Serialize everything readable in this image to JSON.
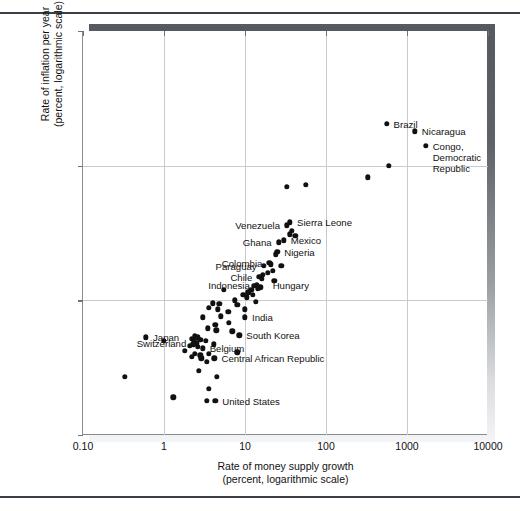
{
  "figure": {
    "background_color": "#ffffff",
    "point_color": "#111111",
    "grid_color": "#c8cbce",
    "shadow_color": "#5d6268",
    "rules": [
      "top-rule",
      "bottom-rule"
    ]
  },
  "chart_data": {
    "type": "scatter",
    "title": "",
    "xlabel_lines": [
      "Rate of money supply growth",
      "(percent, logarithmic scale)"
    ],
    "ylabel_lines": [
      "Rate of inflation per year",
      "(percent, logarithmic scale)"
    ],
    "xscale": "log",
    "yscale": "log",
    "xlim": [
      0.1,
      10000
    ],
    "ylim": [
      1,
      1000
    ],
    "xticks": [
      0.1,
      1,
      10,
      100,
      1000,
      10000
    ],
    "xticklabels": [
      "0.10",
      "1",
      "10",
      "100",
      "1000",
      "10000"
    ],
    "yticks": [
      1,
      10,
      100,
      1000
    ],
    "yticklabels": [
      "1",
      "10",
      "100",
      "1000"
    ],
    "grid": true,
    "legend": "none",
    "labeled_points": [
      {
        "label": "Brazil",
        "x": 560,
        "y": 205,
        "side": "right"
      },
      {
        "label": "Nicaragua",
        "x": 1250,
        "y": 180,
        "side": "right"
      },
      {
        "label": "Congo,\nDemocratic\nRepublic",
        "x": 1700,
        "y": 140,
        "side": "right"
      },
      {
        "label": "Sierra Leone",
        "x": 36,
        "y": 38,
        "side": "right"
      },
      {
        "label": "Venezuela",
        "x": 33,
        "y": 36,
        "side": "left"
      },
      {
        "label": "Mexico",
        "x": 30,
        "y": 28,
        "side": "right"
      },
      {
        "label": "Ghana",
        "x": 26,
        "y": 27,
        "side": "left"
      },
      {
        "label": "Nigeria",
        "x": 25,
        "y": 23,
        "side": "right"
      },
      {
        "label": "Colombia",
        "x": 20,
        "y": 19,
        "side": "left"
      },
      {
        "label": "Paraguay",
        "x": 17,
        "y": 18,
        "side": "left"
      },
      {
        "label": "Chile",
        "x": 15,
        "y": 15,
        "side": "left"
      },
      {
        "label": "Indonesia",
        "x": 14,
        "y": 13,
        "side": "left"
      },
      {
        "label": "Hungary",
        "x": 18,
        "y": 13,
        "side": "right"
      },
      {
        "label": "India",
        "x": 10,
        "y": 7.5,
        "side": "right"
      },
      {
        "label": "Japan",
        "x": 0.6,
        "y": 5.3,
        "side": "right"
      },
      {
        "label": "South Korea",
        "x": 8.5,
        "y": 5.5,
        "side": "right"
      },
      {
        "label": "Switzerland",
        "x": 2.3,
        "y": 4.8,
        "side": "left"
      },
      {
        "label": "Belgium",
        "x": 3.0,
        "y": 4.4,
        "side": "right"
      },
      {
        "label": "Central African Republic",
        "x": 4.2,
        "y": 3.7,
        "side": "right"
      },
      {
        "label": "United States",
        "x": 4.3,
        "y": 1.8,
        "side": "right"
      }
    ],
    "points": [
      {
        "x": 1700,
        "y": 140
      },
      {
        "x": 1250,
        "y": 180
      },
      {
        "x": 560,
        "y": 205
      },
      {
        "x": 600,
        "y": 100
      },
      {
        "x": 330,
        "y": 82
      },
      {
        "x": 56,
        "y": 72
      },
      {
        "x": 33,
        "y": 70
      },
      {
        "x": 36,
        "y": 38
      },
      {
        "x": 38,
        "y": 33
      },
      {
        "x": 36,
        "y": 31
      },
      {
        "x": 42,
        "y": 30
      },
      {
        "x": 33,
        "y": 36
      },
      {
        "x": 30,
        "y": 28
      },
      {
        "x": 26,
        "y": 27
      },
      {
        "x": 25,
        "y": 23
      },
      {
        "x": 24,
        "y": 22
      },
      {
        "x": 20,
        "y": 19
      },
      {
        "x": 21,
        "y": 18.5
      },
      {
        "x": 17,
        "y": 18
      },
      {
        "x": 28,
        "y": 18
      },
      {
        "x": 22,
        "y": 16.5
      },
      {
        "x": 19,
        "y": 16
      },
      {
        "x": 15,
        "y": 15
      },
      {
        "x": 16,
        "y": 14.5
      },
      {
        "x": 16.5,
        "y": 15.5
      },
      {
        "x": 23,
        "y": 14
      },
      {
        "x": 14,
        "y": 13
      },
      {
        "x": 13,
        "y": 12.8
      },
      {
        "x": 15.5,
        "y": 12.5
      },
      {
        "x": 14.5,
        "y": 12.2
      },
      {
        "x": 12,
        "y": 12
      },
      {
        "x": 5.5,
        "y": 12
      },
      {
        "x": 11,
        "y": 11.5
      },
      {
        "x": 12.5,
        "y": 11
      },
      {
        "x": 9.5,
        "y": 11
      },
      {
        "x": 10.5,
        "y": 10.5
      },
      {
        "x": 13.5,
        "y": 9.8
      },
      {
        "x": 7.5,
        "y": 10
      },
      {
        "x": 8,
        "y": 9.3
      },
      {
        "x": 4,
        "y": 9.5
      },
      {
        "x": 4.8,
        "y": 9.4
      },
      {
        "x": 3.6,
        "y": 8.8
      },
      {
        "x": 4.6,
        "y": 8.6
      },
      {
        "x": 10,
        "y": 8.6
      },
      {
        "x": 6.2,
        "y": 8.2
      },
      {
        "x": 3.0,
        "y": 7.5
      },
      {
        "x": 5.0,
        "y": 7.6
      },
      {
        "x": 10,
        "y": 7.5
      },
      {
        "x": 6.3,
        "y": 6.8
      },
      {
        "x": 4.3,
        "y": 6.6
      },
      {
        "x": 4.4,
        "y": 6.0
      },
      {
        "x": 3.5,
        "y": 6.2
      },
      {
        "x": 7.0,
        "y": 5.9
      },
      {
        "x": 0.6,
        "y": 5.3
      },
      {
        "x": 1.0,
        "y": 5.0
      },
      {
        "x": 8.5,
        "y": 5.5
      },
      {
        "x": 2.4,
        "y": 5.4
      },
      {
        "x": 2.6,
        "y": 5.3
      },
      {
        "x": 2.2,
        "y": 5.2
      },
      {
        "x": 2.8,
        "y": 5.1
      },
      {
        "x": 2.35,
        "y": 5.0
      },
      {
        "x": 3.3,
        "y": 5.0
      },
      {
        "x": 2.5,
        "y": 4.8
      },
      {
        "x": 2.3,
        "y": 4.7
      },
      {
        "x": 2.1,
        "y": 4.6
      },
      {
        "x": 4.1,
        "y": 4.7
      },
      {
        "x": 2.6,
        "y": 4.5
      },
      {
        "x": 3.0,
        "y": 4.4
      },
      {
        "x": 1.8,
        "y": 4.2
      },
      {
        "x": 2.4,
        "y": 4.0
      },
      {
        "x": 2.8,
        "y": 3.9
      },
      {
        "x": 3.6,
        "y": 4.0
      },
      {
        "x": 8.0,
        "y": 4.1
      },
      {
        "x": 2.2,
        "y": 3.8
      },
      {
        "x": 2.9,
        "y": 3.7
      },
      {
        "x": 4.2,
        "y": 3.7
      },
      {
        "x": 3.4,
        "y": 3.5
      },
      {
        "x": 0.33,
        "y": 2.7
      },
      {
        "x": 2.7,
        "y": 3.0
      },
      {
        "x": 4.5,
        "y": 2.7
      },
      {
        "x": 3.6,
        "y": 2.2
      },
      {
        "x": 1.3,
        "y": 1.9
      },
      {
        "x": 3.4,
        "y": 1.8
      },
      {
        "x": 4.3,
        "y": 1.8
      }
    ]
  }
}
